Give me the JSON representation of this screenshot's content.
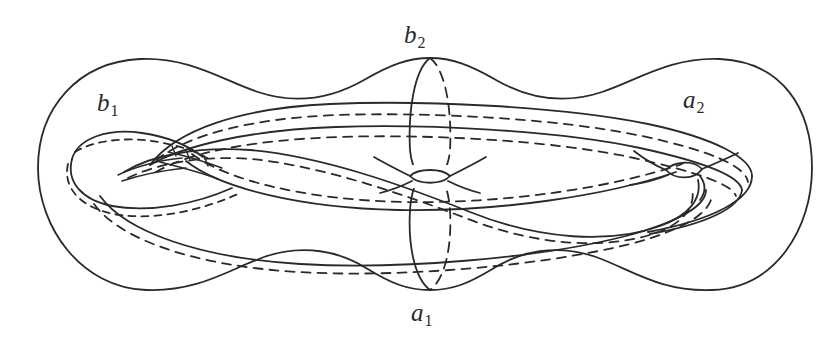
{
  "figure": {
    "kind": "mathematical-diagram",
    "background_color": "#ffffff",
    "stroke_color": "#2a2a2a",
    "width": 834,
    "height": 348
  },
  "labels": {
    "b2": {
      "base": "b",
      "sub": "2",
      "text": "b2",
      "position": "top-center"
    },
    "a1": {
      "base": "a",
      "sub": "1",
      "text": "a1",
      "position": "bottom-center"
    },
    "b1": {
      "base": "b",
      "sub": "1",
      "text": "b1",
      "position": "upper-left"
    },
    "a2": {
      "base": "a",
      "sub": "2",
      "text": "a2",
      "position": "upper-right"
    }
  },
  "geometry": {
    "outline": {
      "name": "genus-2-surface-outline",
      "style": "solid",
      "description": "wavy peanut-shaped closed outer contour with two lobes and a pinched waist at center"
    },
    "handles": [
      {
        "name": "left-handle-hole",
        "center_x": 150,
        "center_y": 172,
        "style": "solid-with-hidden-dashes"
      },
      {
        "name": "right-handle-hole",
        "center_x": 686,
        "center_y": 176,
        "style": "solid-with-hidden-dashes"
      }
    ],
    "waist_pinch": {
      "name": "center-waist",
      "center_x": 430,
      "center_y": 176
    },
    "curves": [
      {
        "name": "b2-meridian",
        "kind": "vertical-ellipse",
        "front": "solid",
        "back": "dashed",
        "cx": 430,
        "cy": 176,
        "rx": 16,
        "ry": 108
      },
      {
        "name": "a2-longitude",
        "kind": "upper-band",
        "front": "solid",
        "back": "dashed"
      },
      {
        "name": "a1-longitude",
        "kind": "lower-band",
        "front": "solid",
        "back": "dashed"
      },
      {
        "name": "b1-meridian",
        "kind": "left-handle-loop",
        "front": "solid",
        "back": "dashed"
      }
    ]
  }
}
